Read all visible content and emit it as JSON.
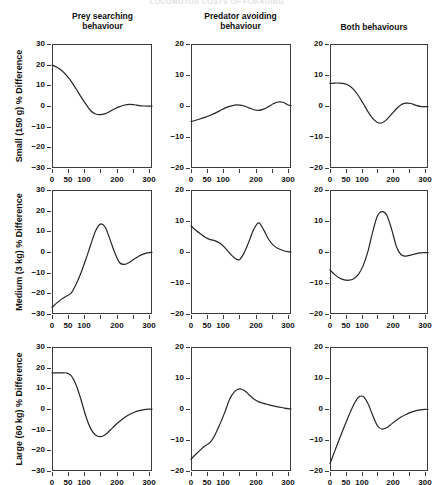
{
  "running_head": "LOCOMOTOR COSTS OF FORAGING",
  "figure": {
    "column_headers": [
      "Prey searching\nbehaviour",
      "Predator avoiding\nbehaviour",
      "Both behaviours"
    ],
    "row_labels": [
      "Small (150 g) % Difference",
      "Medium (3 kg) % Difference",
      "Large (60 kg) % Difference"
    ],
    "line_color": "#262626",
    "axis_color": "#3c3c3c"
  },
  "chart_data": [
    {
      "type": "line",
      "title": "Prey searching behaviour",
      "ylabel": "Small (150 g) % Difference",
      "xlabel": "",
      "xlim": [
        0,
        310
      ],
      "ylim": [
        -30,
        30
      ],
      "xticks": [
        0,
        50,
        100,
        150,
        200,
        250,
        300
      ],
      "xticklabels": [
        "0",
        "50",
        "100",
        "",
        "200",
        "",
        "300"
      ],
      "yticks": [
        -30,
        -20,
        -10,
        0,
        10,
        20,
        30
      ],
      "yticklabels": [
        "-30",
        "-20",
        "-10",
        "0",
        "10",
        "20",
        "30"
      ],
      "grid": false,
      "legend": "none",
      "x": [
        0,
        15,
        30,
        45,
        60,
        75,
        90,
        105,
        120,
        135,
        150,
        165,
        180,
        195,
        210,
        225,
        240,
        255,
        270,
        285,
        300,
        310
      ],
      "y": [
        19.8,
        18.8,
        17.2,
        14.8,
        11.8,
        8.2,
        4.4,
        0.9,
        -2.3,
        -3.9,
        -4.2,
        -3.7,
        -2.6,
        -1.3,
        -0.3,
        0.5,
        0.8,
        0.6,
        0.2,
        0.0,
        -0.1,
        -0.1
      ]
    },
    {
      "type": "line",
      "title": "Predator avoiding behaviour",
      "ylabel": "",
      "xlabel": "",
      "xlim": [
        0,
        310
      ],
      "ylim": [
        -20,
        20
      ],
      "xticks": [
        0,
        50,
        100,
        150,
        200,
        250,
        300
      ],
      "xticklabels": [
        "0",
        "50",
        "100",
        "",
        "200",
        "",
        "300"
      ],
      "yticks": [
        -20,
        -10,
        0,
        10,
        20
      ],
      "yticklabels": [
        "-20",
        "-10",
        "0",
        "10",
        "20"
      ],
      "grid": false,
      "legend": "none",
      "x": [
        0,
        15,
        30,
        45,
        60,
        75,
        90,
        105,
        120,
        135,
        150,
        165,
        180,
        195,
        210,
        225,
        240,
        255,
        270,
        285,
        300,
        310
      ],
      "y": [
        -5.0,
        -4.6,
        -4.1,
        -3.6,
        -3.0,
        -2.3,
        -1.5,
        -0.7,
        -0.1,
        0.3,
        0.3,
        0.0,
        -0.6,
        -1.2,
        -1.4,
        -1.0,
        -0.2,
        0.7,
        1.3,
        1.2,
        0.4,
        0.1
      ]
    },
    {
      "type": "line",
      "title": "Both behaviours",
      "ylabel": "",
      "xlabel": "",
      "xlim": [
        0,
        310
      ],
      "ylim": [
        -20,
        20
      ],
      "xticks": [
        0,
        50,
        100,
        150,
        200,
        250,
        300
      ],
      "xticklabels": [
        "0",
        "50",
        "100",
        "",
        "200",
        "",
        "300"
      ],
      "yticks": [
        -20,
        -10,
        0,
        10,
        20
      ],
      "yticklabels": [
        "-20",
        "-10",
        "0",
        "10",
        "20"
      ],
      "grid": false,
      "legend": "none",
      "x": [
        0,
        15,
        30,
        45,
        60,
        75,
        90,
        105,
        120,
        135,
        150,
        165,
        180,
        195,
        210,
        225,
        240,
        255,
        270,
        285,
        300,
        310
      ],
      "y": [
        7.3,
        7.4,
        7.4,
        7.2,
        6.6,
        5.3,
        3.3,
        0.8,
        -1.8,
        -4.0,
        -5.3,
        -5.4,
        -4.3,
        -2.6,
        -0.9,
        0.4,
        0.9,
        0.8,
        0.3,
        -0.1,
        -0.2,
        -0.2
      ]
    },
    {
      "type": "line",
      "title": "Prey searching behaviour",
      "ylabel": "Medium (3 kg) % Difference",
      "xlabel": "",
      "xlim": [
        0,
        310
      ],
      "ylim": [
        -30,
        30
      ],
      "xticks": [
        0,
        50,
        100,
        150,
        200,
        250,
        300
      ],
      "xticklabels": [
        "0",
        "50",
        "100",
        "",
        "200",
        "",
        "300"
      ],
      "yticks": [
        -30,
        -20,
        -10,
        0,
        10,
        20,
        30
      ],
      "yticklabels": [
        "-30",
        "-20",
        "-10",
        "0",
        "10",
        "20",
        "30"
      ],
      "grid": false,
      "legend": "none",
      "x": [
        0,
        15,
        30,
        45,
        60,
        75,
        90,
        105,
        120,
        135,
        150,
        165,
        180,
        195,
        210,
        225,
        240,
        255,
        270,
        285,
        300,
        310
      ],
      "y": [
        -26.8,
        -24.6,
        -22.8,
        -21.3,
        -19.8,
        -15.5,
        -10.0,
        -3.5,
        3.5,
        10.2,
        13.5,
        12.0,
        6.0,
        -0.5,
        -5.2,
        -6.0,
        -5.0,
        -3.4,
        -1.9,
        -0.9,
        -0.3,
        -0.2
      ]
    },
    {
      "type": "line",
      "title": "Predator avoiding behaviour",
      "ylabel": "",
      "xlabel": "",
      "xlim": [
        0,
        310
      ],
      "ylim": [
        -20,
        20
      ],
      "xticks": [
        0,
        50,
        100,
        150,
        200,
        250,
        300
      ],
      "xticklabels": [
        "0",
        "50",
        "100",
        "",
        "200",
        "",
        "300"
      ],
      "yticks": [
        -20,
        -10,
        0,
        10,
        20
      ],
      "yticklabels": [
        "-20",
        "-10",
        "0",
        "10",
        "20"
      ],
      "grid": false,
      "legend": "none",
      "x": [
        0,
        15,
        30,
        45,
        60,
        75,
        90,
        105,
        120,
        135,
        150,
        165,
        180,
        195,
        210,
        225,
        240,
        255,
        270,
        285,
        300,
        310
      ],
      "y": [
        8.4,
        7.0,
        5.8,
        4.7,
        4.0,
        3.6,
        2.8,
        1.4,
        -0.4,
        -1.9,
        -2.5,
        -0.2,
        3.5,
        7.4,
        9.4,
        7.2,
        4.2,
        2.2,
        1.1,
        0.5,
        0.1,
        0.0
      ]
    },
    {
      "type": "line",
      "title": "Both behaviours",
      "ylabel": "",
      "xlabel": "",
      "xlim": [
        0,
        310
      ],
      "ylim": [
        -20,
        20
      ],
      "xticks": [
        0,
        50,
        100,
        150,
        200,
        250,
        300
      ],
      "xticklabels": [
        "0",
        "50",
        "100",
        "",
        "200",
        "",
        "300"
      ],
      "yticks": [
        -20,
        -10,
        0,
        10,
        20
      ],
      "yticklabels": [
        "-20",
        "-10",
        "0",
        "10",
        "20"
      ],
      "grid": false,
      "legend": "none",
      "x": [
        0,
        15,
        30,
        45,
        60,
        75,
        90,
        105,
        120,
        135,
        150,
        165,
        180,
        195,
        210,
        225,
        240,
        255,
        270,
        285,
        300,
        310
      ],
      "y": [
        -5.8,
        -7.3,
        -8.4,
        -9.0,
        -9.1,
        -8.6,
        -7.2,
        -4.4,
        0.2,
        6.5,
        11.6,
        13.0,
        11.8,
        7.3,
        1.8,
        -0.9,
        -1.3,
        -1.0,
        -0.6,
        -0.3,
        -0.2,
        -0.2
      ]
    },
    {
      "type": "line",
      "title": "Prey searching behaviour",
      "ylabel": "Large (60 kg) % Difference",
      "xlabel": "",
      "xlim": [
        0,
        310
      ],
      "ylim": [
        -30,
        30
      ],
      "xticks": [
        0,
        50,
        100,
        150,
        200,
        250,
        300
      ],
      "xticklabels": [
        "0",
        "50",
        "100",
        "",
        "200",
        "",
        "300"
      ],
      "yticks": [
        -30,
        -20,
        -10,
        0,
        10,
        20,
        30
      ],
      "yticklabels": [
        "-30",
        "-20",
        "-10",
        "0",
        "10",
        "20",
        "30"
      ],
      "grid": false,
      "legend": "none",
      "x": [
        0,
        15,
        30,
        45,
        60,
        75,
        90,
        105,
        120,
        135,
        150,
        165,
        180,
        195,
        210,
        225,
        240,
        255,
        270,
        285,
        300,
        310
      ],
      "y": [
        17.5,
        17.5,
        17.5,
        17.4,
        16.0,
        11.5,
        4.5,
        -3.5,
        -9.5,
        -12.6,
        -13.4,
        -12.4,
        -10.3,
        -8.0,
        -5.9,
        -4.1,
        -2.7,
        -1.6,
        -0.8,
        -0.3,
        -0.1,
        -0.1
      ]
    },
    {
      "type": "line",
      "title": "Predator avoiding behaviour",
      "ylabel": "",
      "xlabel": "",
      "xlim": [
        0,
        310
      ],
      "ylim": [
        -20,
        20
      ],
      "xticks": [
        0,
        50,
        100,
        150,
        200,
        250,
        300
      ],
      "xticklabels": [
        "0",
        "50",
        "100",
        "",
        "200",
        "",
        "300"
      ],
      "yticks": [
        -20,
        -10,
        0,
        10,
        20
      ],
      "yticklabels": [
        "-20",
        "-10",
        "0",
        "10",
        "20"
      ],
      "grid": false,
      "legend": "none",
      "x": [
        0,
        15,
        30,
        45,
        60,
        75,
        90,
        105,
        120,
        135,
        150,
        165,
        180,
        195,
        210,
        225,
        240,
        255,
        270,
        285,
        300,
        310
      ],
      "y": [
        -16.2,
        -14.6,
        -13.1,
        -11.8,
        -10.7,
        -8.2,
        -4.8,
        -1.0,
        3.2,
        5.6,
        6.5,
        6.0,
        4.6,
        3.2,
        2.3,
        1.8,
        1.4,
        1.0,
        0.7,
        0.4,
        0.1,
        0.0
      ]
    },
    {
      "type": "line",
      "title": "Both behaviours",
      "ylabel": "",
      "xlabel": "",
      "xlim": [
        0,
        310
      ],
      "ylim": [
        -20,
        20
      ],
      "xticks": [
        0,
        50,
        100,
        150,
        200,
        250,
        300
      ],
      "xticklabels": [
        "0",
        "50",
        "100",
        "",
        "200",
        "",
        "300"
      ],
      "yticks": [
        -20,
        -10,
        0,
        10,
        20
      ],
      "yticklabels": [
        "-20",
        "-10",
        "0",
        "10",
        "20"
      ],
      "grid": false,
      "legend": "none",
      "x": [
        0,
        15,
        30,
        45,
        60,
        75,
        90,
        105,
        120,
        135,
        150,
        165,
        180,
        195,
        210,
        225,
        240,
        255,
        270,
        285,
        300,
        310
      ],
      "y": [
        -17.6,
        -13.6,
        -9.6,
        -5.7,
        -2.0,
        1.4,
        3.8,
        4.0,
        1.8,
        -2.0,
        -5.4,
        -6.5,
        -6.0,
        -4.8,
        -3.6,
        -2.6,
        -1.8,
        -1.1,
        -0.6,
        -0.3,
        -0.1,
        -0.1
      ]
    }
  ]
}
